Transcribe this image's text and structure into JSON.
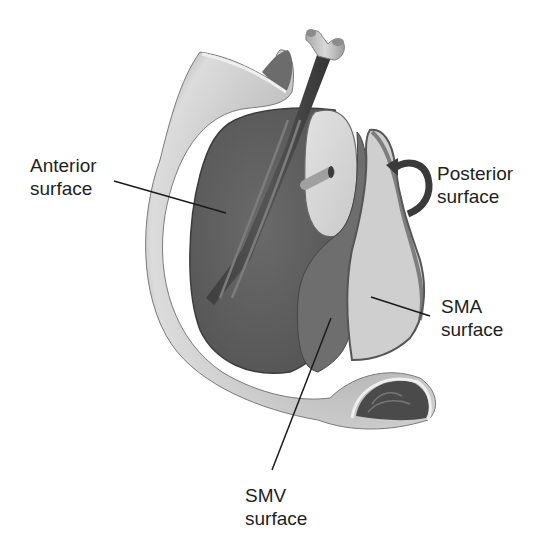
{
  "figure": {
    "type": "anatomical illustration",
    "colors": {
      "background": "#ffffff",
      "tissue_dark": "#5f5f5f",
      "tissue_light": "#d6d6d6",
      "duodenum": "#bdbdbd",
      "label_text": "#1e1e1e",
      "leader_line": "#1a1a1a"
    }
  },
  "labels": {
    "anterior": {
      "line1": "Anterior",
      "line2": "surface"
    },
    "posterior": {
      "line1": "Posterior",
      "line2": "surface"
    },
    "sma": {
      "line1": "SMA",
      "line2": "surface"
    },
    "smv": {
      "line1": "SMV",
      "line2": "surface"
    }
  },
  "icons": {
    "rotation_arrow": "curved-arrow-rotate"
  },
  "caption": {
    "text": "",
    "note": "caption line cropped at bottom edge; only letter tops visible"
  }
}
